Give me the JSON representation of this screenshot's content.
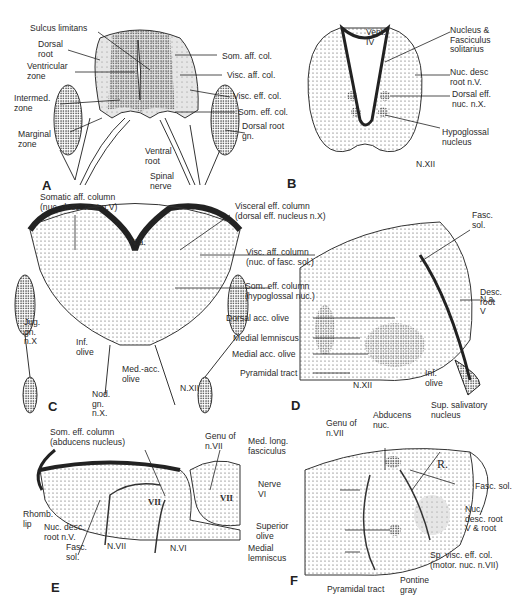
{
  "figure": {
    "panels": [
      {
        "id": "A",
        "letter": "A",
        "title": "Spinal cord cross-section",
        "labels": [
          "Sulcus limitans",
          "Dorsal\nroot",
          "Ventricular\nzone",
          "Intermed.\nzone",
          "Marginal\nzone",
          "Som. aff. col.",
          "Visc. aff. col.",
          "Visc. eff. col.",
          "Som. eff. col.",
          "Dorsal root\ngn.",
          "Ventral\nroot",
          "Spinal\nnerve"
        ]
      },
      {
        "id": "B",
        "letter": "B",
        "title": "Medulla cross-section",
        "labels": [
          "Vent.\nIV",
          "Nucleus &\nFasciculus\nsolitarius",
          "Nuc. desc\nroot n.V.",
          "Dorsal eff.\nnuc. n.X.",
          "Hypoglossal\nnucleus",
          "N.XII"
        ]
      },
      {
        "id": "C",
        "letter": "C",
        "title": "Embryonic medulla",
        "labels": [
          "Somatic aff. column\n(nuc. desc. root n.V)",
          "Visceral eff. column\n(dorsal eff. nucleus n.X)",
          "N.a.",
          "Visc. aff. column\n(nuc. of fasc. sol.)",
          "Som. eff. column\n(hypoglossal nuc.)",
          "Jug.\ngn.\nn.X",
          "Inf.\nolive",
          "Med.-acc.\nolive",
          "N.XII",
          "Nod.\ngn.\nn.X."
        ]
      },
      {
        "id": "D",
        "letter": "D",
        "title": "Adult medulla",
        "labels": [
          "Fasc.\nsol.",
          "N.a.",
          "Desc.\nroot\nV",
          "Dorsal acc. olive",
          "Medial lemniscus",
          "Medial acc. olive",
          "Pyramidal tract",
          "N.XII",
          "Inf.\nolive"
        ]
      },
      {
        "id": "E",
        "letter": "E",
        "title": "Embryonic pons",
        "labels": [
          "Som. eff. column\n(abducens nucleus)",
          "Genu of\nn.VII",
          "Rhomb.\nlip",
          "Nuc. desc.\nroot n.V.",
          "Fasc.\nsol.",
          "N.VII",
          "N.VI",
          "VII",
          "VII"
        ]
      },
      {
        "id": "F",
        "letter": "F",
        "title": "Adult pons",
        "labels": [
          "Genu of\nn.VII",
          "Abducens\nnuc.",
          "Sup. salivatory\nnucleus",
          "Med. long.\nfasciculus",
          "R.",
          "Fasc. sol.",
          "Nerve\nVI",
          "Nuc.\ndesc. root\nV & root",
          "Superior\nolive",
          "Medial\nlemniscus",
          "Sp. visc. eff. col.\n(motor. nuc. n.VII)",
          "Pyramidal tract",
          "Pontine\ngray"
        ]
      }
    ]
  },
  "colors": {
    "ink": "#2a2a2a",
    "shade": "#d6d6d6",
    "paper": "#ffffff"
  }
}
